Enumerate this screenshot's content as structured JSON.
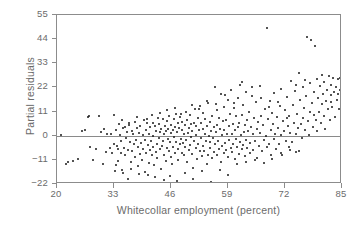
{
  "chart_data": {
    "type": "scatter",
    "title": "",
    "xlabel": "Whitecollar employment (percent)",
    "ylabel": "Partial residuals",
    "xlim": [
      20,
      85
    ],
    "ylim": [
      -22,
      55
    ],
    "xticks": [
      20,
      33,
      46,
      59,
      72,
      85
    ],
    "yticks": [
      -22,
      -11,
      0,
      11,
      22,
      33,
      44,
      55
    ],
    "xtick_labels": [
      "20",
      "33",
      "46",
      "59",
      "72",
      "85"
    ],
    "ytick_labels": [
      "−22",
      "−11",
      "0",
      "11",
      "22",
      "33",
      "44",
      "55"
    ],
    "grid": false,
    "legend": null,
    "reference_lines": [
      {
        "axis": "y",
        "value": 0,
        "color": "#8a8a8a"
      }
    ],
    "marker": {
      "shape": "circle",
      "size": 2,
      "color": "#1a1a1a"
    },
    "frame_color": "#8c8c8c",
    "text_color": "#6b6b6b",
    "background": "#ffffff",
    "n_points": 418,
    "points": [
      [
        21.0,
        0.5
      ],
      [
        22.1,
        -13.0
      ],
      [
        23.6,
        -11.5
      ],
      [
        25.6,
        2.2
      ],
      [
        26.4,
        2.4
      ],
      [
        27.0,
        8.6
      ],
      [
        27.3,
        9.0
      ],
      [
        27.6,
        -5.0
      ],
      [
        28.1,
        -11.0
      ],
      [
        29.5,
        9.2
      ],
      [
        30.4,
        -13.0
      ],
      [
        30.8,
        3.0
      ],
      [
        31.2,
        -7.5
      ],
      [
        31.5,
        0.6
      ],
      [
        32.0,
        -5.5
      ],
      [
        32.4,
        1.0
      ],
      [
        32.6,
        -8.0
      ],
      [
        32.9,
        -4.0
      ],
      [
        33.1,
        9.6
      ],
      [
        33.3,
        -16.0
      ],
      [
        33.5,
        2.8
      ],
      [
        33.6,
        -4.5
      ],
      [
        33.8,
        -6.0
      ],
      [
        33.9,
        -11.5
      ],
      [
        34.1,
        5.2
      ],
      [
        34.3,
        0.2
      ],
      [
        34.5,
        -8.0
      ],
      [
        34.6,
        -2.2
      ],
      [
        34.8,
        -15.5
      ],
      [
        35.0,
        3.6
      ],
      [
        35.2,
        -5.4
      ],
      [
        35.4,
        4.0
      ],
      [
        35.6,
        -9.0
      ],
      [
        35.8,
        -1.2
      ],
      [
        36.0,
        1.6
      ],
      [
        36.1,
        -19.5
      ],
      [
        36.3,
        -6.5
      ],
      [
        36.5,
        5.0
      ],
      [
        36.6,
        -3.0
      ],
      [
        36.8,
        -12.0
      ],
      [
        37.0,
        2.0
      ],
      [
        37.2,
        -7.0
      ],
      [
        37.4,
        0.8
      ],
      [
        37.5,
        -4.0
      ],
      [
        37.7,
        6.2
      ],
      [
        37.9,
        -9.5
      ],
      [
        38.0,
        -1.8
      ],
      [
        38.2,
        3.4
      ],
      [
        38.4,
        -14.0
      ],
      [
        38.5,
        -5.0
      ],
      [
        38.7,
        1.2
      ],
      [
        38.9,
        -8.5
      ],
      [
        39.0,
        4.4
      ],
      [
        39.2,
        -3.2
      ],
      [
        39.4,
        -11.0
      ],
      [
        39.5,
        0.4
      ],
      [
        39.7,
        -6.0
      ],
      [
        39.8,
        7.0
      ],
      [
        40.0,
        -2.0
      ],
      [
        40.1,
        -16.5
      ],
      [
        40.3,
        2.6
      ],
      [
        40.4,
        -8.0
      ],
      [
        40.6,
        5.6
      ],
      [
        40.7,
        -4.2
      ],
      [
        40.9,
        -12.5
      ],
      [
        41.0,
        1.0
      ],
      [
        41.2,
        -6.5
      ],
      [
        41.3,
        3.8
      ],
      [
        41.5,
        -2.5
      ],
      [
        41.6,
        -9.0
      ],
      [
        41.8,
        6.0
      ],
      [
        41.9,
        -5.0
      ],
      [
        42.0,
        0.0
      ],
      [
        42.2,
        -13.5
      ],
      [
        42.3,
        4.2
      ],
      [
        42.5,
        -7.5
      ],
      [
        42.6,
        2.2
      ],
      [
        42.8,
        -3.6
      ],
      [
        42.9,
        -10.0
      ],
      [
        43.0,
        8.0
      ],
      [
        43.2,
        -1.0
      ],
      [
        43.3,
        5.4
      ],
      [
        43.4,
        -6.2
      ],
      [
        43.6,
        1.8
      ],
      [
        43.7,
        -15.0
      ],
      [
        43.8,
        3.0
      ],
      [
        44.0,
        -4.8
      ],
      [
        44.1,
        7.4
      ],
      [
        44.2,
        -2.6
      ],
      [
        44.4,
        -8.8
      ],
      [
        44.5,
        0.6
      ],
      [
        44.6,
        4.6
      ],
      [
        44.8,
        -11.5
      ],
      [
        44.9,
        2.0
      ],
      [
        45.0,
        -5.6
      ],
      [
        45.1,
        6.8
      ],
      [
        45.3,
        -1.4
      ],
      [
        45.4,
        3.2
      ],
      [
        45.5,
        -7.0
      ],
      [
        45.6,
        9.0
      ],
      [
        45.8,
        -3.0
      ],
      [
        45.9,
        1.4
      ],
      [
        46.0,
        -9.6
      ],
      [
        46.1,
        5.0
      ],
      [
        46.2,
        -13.0
      ],
      [
        46.4,
        2.4
      ],
      [
        46.5,
        -5.0
      ],
      [
        46.6,
        7.8
      ],
      [
        46.7,
        -0.6
      ],
      [
        46.9,
        4.0
      ],
      [
        47.0,
        -8.0
      ],
      [
        47.1,
        10.0
      ],
      [
        47.2,
        -2.8
      ],
      [
        47.4,
        1.6
      ],
      [
        47.5,
        -6.0
      ],
      [
        47.6,
        5.8
      ],
      [
        47.7,
        -11.0
      ],
      [
        47.9,
        3.6
      ],
      [
        48.0,
        -4.0
      ],
      [
        48.1,
        8.4
      ],
      [
        48.2,
        -1.6
      ],
      [
        48.4,
        2.8
      ],
      [
        48.5,
        -7.8
      ],
      [
        48.6,
        6.4
      ],
      [
        48.7,
        -3.4
      ],
      [
        48.9,
        0.8
      ],
      [
        49.0,
        -9.0
      ],
      [
        49.1,
        4.8
      ],
      [
        49.2,
        -5.2
      ],
      [
        49.4,
        11.0
      ],
      [
        49.5,
        -2.0
      ],
      [
        49.6,
        7.0
      ],
      [
        49.7,
        -12.0
      ],
      [
        49.9,
        1.2
      ],
      [
        50.0,
        -6.6
      ],
      [
        50.1,
        3.4
      ],
      [
        50.3,
        9.4
      ],
      [
        50.4,
        -4.4
      ],
      [
        50.5,
        -0.4
      ],
      [
        50.6,
        5.2
      ],
      [
        50.8,
        -8.2
      ],
      [
        50.9,
        2.2
      ],
      [
        51.0,
        -14.5
      ],
      [
        51.2,
        6.0
      ],
      [
        51.3,
        -2.4
      ],
      [
        51.4,
        12.0
      ],
      [
        51.6,
        -5.8
      ],
      [
        51.7,
        0.2
      ],
      [
        51.8,
        4.2
      ],
      [
        52.0,
        -10.5
      ],
      [
        52.1,
        8.0
      ],
      [
        52.2,
        -3.8
      ],
      [
        52.4,
        2.6
      ],
      [
        52.5,
        -7.0
      ],
      [
        52.6,
        13.5
      ],
      [
        52.8,
        -1.0
      ],
      [
        52.9,
        5.6
      ],
      [
        53.0,
        -9.4
      ],
      [
        53.2,
        3.0
      ],
      [
        53.3,
        -4.6
      ],
      [
        53.4,
        10.2
      ],
      [
        53.6,
        -6.8
      ],
      [
        53.7,
        1.0
      ],
      [
        53.8,
        7.6
      ],
      [
        54.0,
        -2.2
      ],
      [
        54.1,
        -12.8
      ],
      [
        54.2,
        4.4
      ],
      [
        54.4,
        -8.6
      ],
      [
        54.5,
        15.0
      ],
      [
        54.6,
        0.0
      ],
      [
        54.8,
        -5.4
      ],
      [
        54.9,
        6.2
      ],
      [
        55.0,
        -3.0
      ],
      [
        55.2,
        2.0
      ],
      [
        55.3,
        -10.0
      ],
      [
        55.4,
        9.0
      ],
      [
        55.6,
        -1.2
      ],
      [
        55.7,
        4.0
      ],
      [
        55.8,
        -7.2
      ],
      [
        56.0,
        22.0
      ],
      [
        56.1,
        -4.0
      ],
      [
        56.2,
        1.6
      ],
      [
        56.4,
        11.5
      ],
      [
        56.5,
        -9.0
      ],
      [
        56.6,
        5.0
      ],
      [
        56.8,
        -2.6
      ],
      [
        56.9,
        8.2
      ],
      [
        57.0,
        -6.0
      ],
      [
        57.2,
        3.2
      ],
      [
        57.3,
        -11.8
      ],
      [
        57.4,
        19.0
      ],
      [
        57.6,
        0.4
      ],
      [
        57.7,
        -4.8
      ],
      [
        57.8,
        6.6
      ],
      [
        58.0,
        -8.0
      ],
      [
        58.1,
        2.4
      ],
      [
        58.2,
        13.0
      ],
      [
        58.4,
        -3.2
      ],
      [
        58.5,
        7.0
      ],
      [
        58.6,
        -6.4
      ],
      [
        58.8,
        1.0
      ],
      [
        58.9,
        16.5
      ],
      [
        59.0,
        -9.8
      ],
      [
        59.2,
        4.6
      ],
      [
        59.3,
        -2.0
      ],
      [
        59.4,
        10.0
      ],
      [
        59.6,
        -5.6
      ],
      [
        59.7,
        21.0
      ],
      [
        59.8,
        0.8
      ],
      [
        60.0,
        -7.4
      ],
      [
        60.1,
        5.4
      ],
      [
        60.2,
        -3.6
      ],
      [
        60.4,
        12.5
      ],
      [
        60.5,
        -10.4
      ],
      [
        60.6,
        2.8
      ],
      [
        60.8,
        8.8
      ],
      [
        60.9,
        -1.4
      ],
      [
        61.0,
        -5.0
      ],
      [
        61.2,
        17.0
      ],
      [
        61.3,
        3.8
      ],
      [
        61.4,
        -8.4
      ],
      [
        61.6,
        6.0
      ],
      [
        61.7,
        -2.8
      ],
      [
        61.8,
        23.0
      ],
      [
        62.0,
        0.2
      ],
      [
        62.1,
        -6.2
      ],
      [
        62.2,
        9.6
      ],
      [
        62.4,
        -4.2
      ],
      [
        62.5,
        14.0
      ],
      [
        62.6,
        1.8
      ],
      [
        62.8,
        -9.2
      ],
      [
        62.9,
        5.0
      ],
      [
        63.0,
        -1.8
      ],
      [
        63.2,
        20.0
      ],
      [
        63.3,
        7.2
      ],
      [
        63.4,
        -5.8
      ],
      [
        63.6,
        2.2
      ],
      [
        63.8,
        11.0
      ],
      [
        64.0,
        -3.4
      ],
      [
        64.1,
        -8.0
      ],
      [
        64.3,
        4.0
      ],
      [
        64.5,
        18.0
      ],
      [
        64.6,
        0.6
      ],
      [
        64.8,
        -6.6
      ],
      [
        65.0,
        8.0
      ],
      [
        65.2,
        -2.4
      ],
      [
        65.4,
        15.5
      ],
      [
        65.5,
        3.0
      ],
      [
        65.7,
        -10.0
      ],
      [
        65.9,
        6.4
      ],
      [
        66.0,
        -4.6
      ],
      [
        66.2,
        22.5
      ],
      [
        66.4,
        1.2
      ],
      [
        66.6,
        9.0
      ],
      [
        66.8,
        -7.0
      ],
      [
        67.0,
        4.8
      ],
      [
        67.2,
        -2.0
      ],
      [
        67.4,
        12.0
      ],
      [
        67.6,
        0.0
      ],
      [
        67.8,
        -5.2
      ],
      [
        68.0,
        49.0
      ],
      [
        68.1,
        7.6
      ],
      [
        68.3,
        -3.8
      ],
      [
        68.5,
        16.0
      ],
      [
        68.7,
        2.6
      ],
      [
        68.9,
        -8.6
      ],
      [
        69.0,
        10.5
      ],
      [
        69.2,
        5.2
      ],
      [
        69.4,
        -1.6
      ],
      [
        69.6,
        19.5
      ],
      [
        69.8,
        1.0
      ],
      [
        70.0,
        -6.0
      ],
      [
        70.2,
        8.4
      ],
      [
        70.4,
        3.4
      ],
      [
        70.6,
        -4.0
      ],
      [
        70.8,
        13.5
      ],
      [
        71.0,
        0.4
      ],
      [
        71.2,
        21.5
      ],
      [
        71.4,
        -9.0
      ],
      [
        71.6,
        6.8
      ],
      [
        71.8,
        2.0
      ],
      [
        72.0,
        11.5
      ],
      [
        72.2,
        -2.2
      ],
      [
        72.4,
        17.5
      ],
      [
        72.6,
        4.2
      ],
      [
        72.8,
        -5.0
      ],
      [
        73.0,
        9.2
      ],
      [
        73.2,
        1.4
      ],
      [
        73.4,
        25.0
      ],
      [
        73.6,
        -3.0
      ],
      [
        73.8,
        14.0
      ],
      [
        74.0,
        6.0
      ],
      [
        74.2,
        20.5
      ],
      [
        74.4,
        0.8
      ],
      [
        74.6,
        -7.5
      ],
      [
        74.8,
        10.0
      ],
      [
        75.0,
        3.6
      ],
      [
        75.2,
        28.5
      ],
      [
        75.4,
        16.5
      ],
      [
        75.6,
        5.4
      ],
      [
        75.8,
        -1.0
      ],
      [
        76.0,
        22.0
      ],
      [
        76.2,
        8.0
      ],
      [
        76.4,
        12.5
      ],
      [
        76.6,
        2.4
      ],
      [
        76.8,
        18.0
      ],
      [
        77.0,
        45.0
      ],
      [
        77.2,
        6.6
      ],
      [
        77.4,
        0.2
      ],
      [
        77.6,
        24.0
      ],
      [
        77.8,
        10.8
      ],
      [
        78.0,
        43.5
      ],
      [
        78.2,
        15.0
      ],
      [
        78.4,
        4.0
      ],
      [
        78.6,
        20.0
      ],
      [
        78.8,
        41.0
      ],
      [
        79.0,
        7.2
      ],
      [
        79.2,
        26.0
      ],
      [
        79.4,
        2.0
      ],
      [
        79.6,
        17.0
      ],
      [
        79.8,
        11.0
      ],
      [
        80.0,
        22.5
      ],
      [
        80.2,
        5.8
      ],
      [
        80.4,
        14.5
      ],
      [
        80.6,
        19.0
      ],
      [
        80.8,
        9.0
      ],
      [
        81.0,
        24.5
      ],
      [
        81.2,
        3.0
      ],
      [
        81.4,
        16.0
      ],
      [
        81.6,
        21.0
      ],
      [
        81.8,
        12.0
      ],
      [
        82.0,
        27.0
      ],
      [
        82.2,
        7.0
      ],
      [
        82.4,
        18.5
      ],
      [
        82.6,
        23.0
      ],
      [
        82.8,
        13.0
      ],
      [
        83.0,
        26.5
      ],
      [
        83.2,
        20.0
      ],
      [
        83.4,
        8.5
      ],
      [
        83.6,
        22.0
      ],
      [
        83.8,
        16.5
      ],
      [
        84.0,
        26.0
      ],
      [
        84.2,
        19.0
      ],
      [
        84.4,
        12.0
      ],
      [
        84.6,
        26.5
      ],
      [
        84.8,
        23.5
      ],
      [
        22.6,
        -12.0
      ],
      [
        24.8,
        -10.8
      ],
      [
        29.0,
        -6.0
      ],
      [
        30.0,
        1.5
      ],
      [
        33.4,
        -13.5
      ],
      [
        35.1,
        -17.0
      ],
      [
        36.9,
        -15.0
      ],
      [
        38.6,
        -17.5
      ],
      [
        40.8,
        -18.0
      ],
      [
        42.4,
        -19.0
      ],
      [
        44.3,
        -20.0
      ],
      [
        45.7,
        -18.5
      ],
      [
        47.3,
        -20.5
      ],
      [
        49.3,
        -17.0
      ],
      [
        51.1,
        -19.5
      ],
      [
        53.1,
        -16.0
      ],
      [
        55.1,
        -21.0
      ],
      [
        57.1,
        -15.5
      ],
      [
        59.1,
        -18.0
      ],
      [
        61.1,
        -13.0
      ],
      [
        63.1,
        -12.0
      ],
      [
        65.1,
        -11.0
      ],
      [
        67.1,
        -12.5
      ],
      [
        69.1,
        -10.5
      ],
      [
        71.1,
        -8.0
      ],
      [
        73.1,
        -6.5
      ],
      [
        75.1,
        -7.0
      ],
      [
        34.9,
        7.0
      ],
      [
        36.4,
        6.0
      ],
      [
        38.3,
        8.5
      ],
      [
        40.5,
        7.5
      ],
      [
        41.7,
        9.5
      ],
      [
        43.5,
        10.5
      ],
      [
        45.2,
        11.5
      ],
      [
        46.8,
        12.5
      ],
      [
        48.3,
        10.0
      ],
      [
        50.7,
        14.0
      ],
      [
        52.3,
        12.0
      ],
      [
        54.3,
        16.0
      ],
      [
        56.3,
        14.5
      ],
      [
        58.3,
        18.5
      ],
      [
        60.3,
        15.0
      ],
      [
        62.3,
        24.5
      ],
      [
        64.4,
        22.0
      ],
      [
        66.5,
        17.0
      ],
      [
        68.4,
        13.0
      ],
      [
        70.5,
        15.5
      ],
      [
        72.5,
        8.0
      ],
      [
        74.5,
        23.0
      ],
      [
        76.5,
        25.5
      ],
      [
        78.5,
        9.5
      ],
      [
        80.5,
        27.5
      ],
      [
        82.5,
        15.5
      ],
      [
        84.5,
        21.0
      ]
    ]
  }
}
